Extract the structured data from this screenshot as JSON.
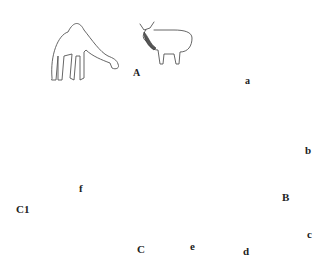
{
  "diagram": {
    "type": "parasite-life-cycle",
    "labels": {
      "definitive_hosts": "A",
      "adult_fluke": "a",
      "egg": "b",
      "snail_host": "B",
      "cercaria": "c",
      "slime_ball": "d",
      "metacercaria_cyst": "e",
      "ant_host": "C",
      "ant_on_grass": "C1",
      "infective_metacercaria": "f"
    },
    "hosts": [
      "camel",
      "cow",
      "goat",
      "sheep",
      "deer"
    ],
    "flow": [
      {
        "from": "deer",
        "to": "adult_fluke"
      },
      {
        "from": "adult_fluke",
        "to": "egg"
      },
      {
        "from": "egg",
        "to": "snail_host"
      },
      {
        "from": "snail_host",
        "to": "slime_ball"
      },
      {
        "from": "snail_host",
        "to": "cercaria"
      },
      {
        "from": "cercaria",
        "to": "slime_ball"
      },
      {
        "from": "slime_ball",
        "to": "metacercaria_cyst"
      },
      {
        "from": "ant_host",
        "to": "ant_on_grass"
      },
      {
        "from": "infective_metacercaria",
        "to": "deer"
      }
    ]
  }
}
